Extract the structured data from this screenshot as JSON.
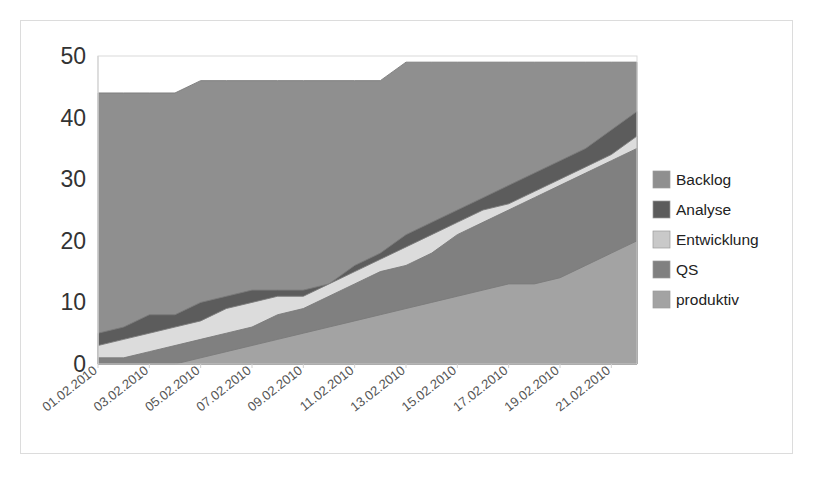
{
  "frame": {
    "border_color": "#dcdcdc",
    "background": "#ffffff"
  },
  "chart_data": {
    "type": "area",
    "stacked": true,
    "title": "",
    "subtitle": "",
    "xlabel": "",
    "ylabel": "",
    "ylim": [
      0,
      50
    ],
    "yticks": [
      0,
      10,
      20,
      30,
      40,
      50
    ],
    "grid": false,
    "legend_position": "right",
    "x": [
      "01.02.2010",
      "02.02.2010",
      "03.02.2010",
      "04.02.2010",
      "05.02.2010",
      "06.02.2010",
      "07.02.2010",
      "08.02.2010",
      "09.02.2010",
      "10.02.2010",
      "11.02.2010",
      "12.02.2010",
      "13.02.2010",
      "14.02.2010",
      "15.02.2010",
      "16.02.2010",
      "17.02.2010",
      "18.02.2010",
      "19.02.2010",
      "20.02.2010",
      "21.02.2010",
      "22.02.2010"
    ],
    "xtick_labels": [
      "01.02.2010",
      "03.02.2010",
      "05.02.2010",
      "07.02.2010",
      "09.02.2010",
      "11.02.2010",
      "13.02.2010",
      "15.02.2010",
      "17.02.2010",
      "19.02.2010",
      "21.02.2010"
    ],
    "xtick_indices": [
      0,
      2,
      4,
      6,
      8,
      10,
      12,
      14,
      16,
      18,
      20
    ],
    "stack_order_bottom_to_top": [
      "produktiv",
      "QS",
      "Entwicklung",
      "Analyse",
      "Backlog"
    ],
    "series": [
      {
        "name": "produktiv",
        "color": "#a3a3a3",
        "values": [
          0,
          0,
          0,
          0,
          1,
          2,
          3,
          4,
          5,
          6,
          7,
          8,
          9,
          10,
          11,
          12,
          13,
          13,
          14,
          16,
          18,
          20
        ]
      },
      {
        "name": "QS",
        "color": "#808080",
        "values": [
          1,
          1,
          2,
          3,
          4,
          5,
          6,
          8,
          9,
          11,
          13,
          15,
          16,
          18,
          21,
          23,
          25,
          27,
          29,
          31,
          33,
          35
        ]
      },
      {
        "name": "Entwicklung",
        "color": "#dcdcdc",
        "values": [
          3,
          4,
          5,
          6,
          7,
          9,
          10,
          11,
          11,
          13,
          15,
          17,
          19,
          21,
          23,
          25,
          26,
          28,
          30,
          32,
          34,
          37
        ]
      },
      {
        "name": "Analyse",
        "color": "#5c5c5c",
        "values": [
          5,
          6,
          8,
          8,
          10,
          11,
          12,
          12,
          12,
          13,
          16,
          18,
          21,
          23,
          25,
          27,
          29,
          31,
          33,
          35,
          38,
          41
        ]
      },
      {
        "name": "Backlog",
        "color": "#8f8f8f",
        "values": [
          44,
          44,
          44,
          44,
          46,
          46,
          46,
          46,
          46,
          46,
          46,
          46,
          49,
          49,
          49,
          49,
          49,
          49,
          49,
          49,
          49,
          49
        ]
      }
    ]
  },
  "legend": {
    "items": [
      {
        "label": "Backlog",
        "color": "#8f8f8f"
      },
      {
        "label": "Analyse",
        "color": "#5c5c5c"
      },
      {
        "label": "Entwicklung",
        "color": "#c9c9c9"
      },
      {
        "label": "QS",
        "color": "#808080"
      },
      {
        "label": "produktiv",
        "color": "#a3a3a3"
      }
    ]
  }
}
